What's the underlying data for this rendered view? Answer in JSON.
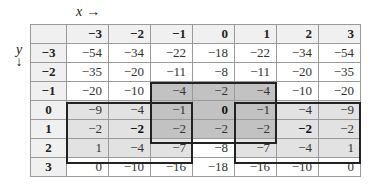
{
  "labels": {
    "x_axis": "x",
    "x_arrow": "→",
    "y_axis": "y",
    "y_arrow": "↓"
  },
  "table": {
    "corner": "",
    "column_headers": [
      "−3",
      "−2",
      "−1",
      "0",
      "1",
      "2",
      "3"
    ],
    "rows": [
      {
        "header": "−3",
        "cells": [
          "−54",
          "−34",
          "−22",
          "−18",
          "−22",
          "−34",
          "−54"
        ]
      },
      {
        "header": "−2",
        "cells": [
          "−35",
          "−20",
          "−11",
          "−8",
          "−11",
          "−20",
          "−35"
        ]
      },
      {
        "header": "−1",
        "cells": [
          "−20",
          "−10",
          "−4",
          "−2",
          "−4",
          "−10",
          "−20"
        ]
      },
      {
        "header": "0",
        "cells": [
          "−9",
          "−4",
          "−1",
          "0",
          "−1",
          "−4",
          "−9"
        ]
      },
      {
        "header": "1",
        "cells": [
          "−2",
          "−2",
          "−2",
          "−2",
          "−2",
          "−2",
          "−2"
        ]
      },
      {
        "header": "2",
        "cells": [
          "1",
          "−4",
          "−7",
          "−8",
          "−7",
          "−4",
          "1"
        ]
      },
      {
        "header": "3",
        "cells": [
          "0",
          "−10",
          "−16",
          "−18",
          "−16",
          "−10",
          "0"
        ]
      }
    ]
  },
  "highlights": {
    "center_box": {
      "rows": [
        "−1",
        "1"
      ],
      "cols": [
        "−1",
        "1"
      ],
      "color": "#c2c2c2"
    },
    "left_box": {
      "rows": [
        "0",
        "2"
      ],
      "cols": [
        "−3",
        "−1"
      ],
      "color": "#e2e2e2"
    },
    "right_box": {
      "rows": [
        "0",
        "2"
      ],
      "cols": [
        "1",
        "3"
      ],
      "color": "#e2e2e2"
    },
    "bold_cells": [
      {
        "row": "0",
        "col": "0",
        "value": "0"
      },
      {
        "row": "1",
        "col": "−2",
        "value": "−2"
      },
      {
        "row": "1",
        "col": "2",
        "value": "−2"
      }
    ]
  }
}
